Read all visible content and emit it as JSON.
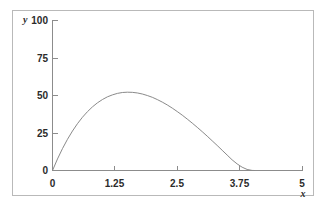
{
  "figure": {
    "background_color": "#ffffff",
    "frame_color": "#b9b9b9",
    "axis_color": "#8c8c8c",
    "curve_color": "#8a8a8a",
    "text_color": "#2b2b2b"
  },
  "chart_data": {
    "type": "line",
    "title": "",
    "xlabel": "x",
    "ylabel": "y",
    "xlim": [
      0,
      5
    ],
    "ylim": [
      0,
      100
    ],
    "grid": false,
    "legend": null,
    "x_ticks": [
      0,
      1.25,
      2.5,
      3.75,
      5
    ],
    "x_tick_labels": [
      "0",
      "1.25",
      "2.5",
      "3.75",
      "5"
    ],
    "y_ticks": [
      0,
      25,
      50,
      75,
      100
    ],
    "y_tick_labels": [
      "0",
      "25",
      "50",
      "75",
      "100"
    ],
    "annotations": {
      "peak_x": 1.22,
      "peak_y": 52,
      "root_x": 4.05
    },
    "series": [
      {
        "name": "curve",
        "x": [
          0,
          0.1,
          0.2,
          0.3,
          0.4,
          0.5,
          0.6,
          0.7,
          0.8,
          0.9,
          1.0,
          1.1,
          1.2,
          1.3,
          1.4,
          1.5,
          1.6,
          1.7,
          1.8,
          1.9,
          2.0,
          2.1,
          2.2,
          2.3,
          2.4,
          2.5,
          2.6,
          2.7,
          2.8,
          2.9,
          3.0,
          3.1,
          3.2,
          3.3,
          3.4,
          3.5,
          3.6,
          3.7,
          3.8,
          3.9,
          4.0,
          4.05
        ],
        "y": [
          0,
          7.7,
          14.6,
          20.8,
          26.3,
          31.2,
          35.5,
          39.2,
          42.4,
          45.1,
          47.3,
          49.1,
          50.4,
          51.4,
          52.0,
          52.2,
          52.1,
          51.7,
          51.0,
          50.0,
          48.8,
          47.3,
          45.6,
          43.7,
          41.6,
          39.3,
          36.9,
          34.3,
          31.6,
          28.8,
          25.9,
          22.9,
          19.8,
          16.7,
          13.5,
          10.3,
          7.1,
          4.4,
          2.2,
          0.7,
          0.05,
          0
        ]
      }
    ]
  },
  "labels": {
    "y_axis_name": "y",
    "x_axis_name": "x"
  }
}
